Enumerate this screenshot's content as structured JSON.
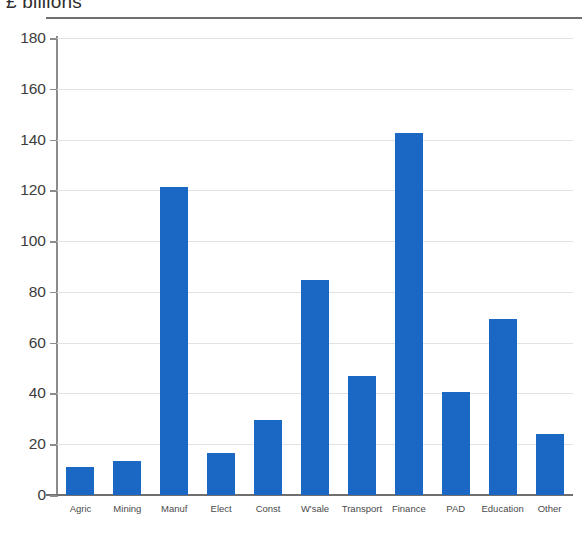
{
  "chart_data": {
    "type": "bar",
    "title": "£ billions",
    "subtitle": "",
    "xlabel": "",
    "ylabel": "",
    "ylim": [
      0,
      180
    ],
    "yticks": [
      0,
      20,
      40,
      60,
      80,
      100,
      120,
      140,
      160,
      180
    ],
    "ytick_labels": [
      "0",
      "20",
      "40",
      "60",
      "80",
      "100",
      "120",
      "140",
      "160",
      "180"
    ],
    "grid": true,
    "legend": false,
    "bar_color": "#1a68c4",
    "categories": [
      "Agric",
      "Mining",
      "Manuf",
      "Elect",
      "Const",
      "W'sale",
      "Transport",
      "Finance",
      "PAD",
      "Education",
      "Other"
    ],
    "values": [
      11,
      13.5,
      121.5,
      16.5,
      29.5,
      84.5,
      47,
      142.5,
      40.7,
      69.5,
      24
    ]
  }
}
